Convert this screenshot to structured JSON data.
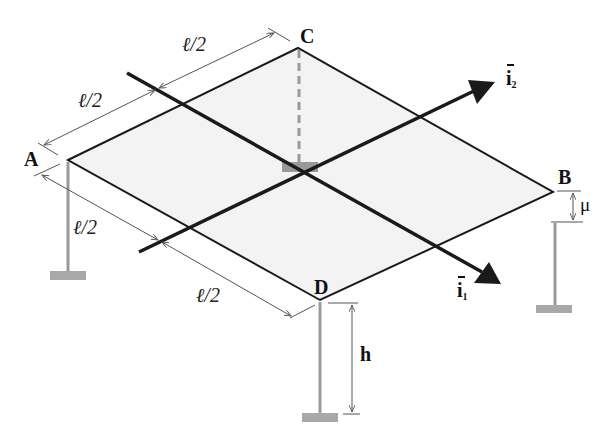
{
  "figure": {
    "type": "isometric plate on three columns",
    "colors": {
      "plate_fill": "#f3f3f3",
      "plate_edge": "#1a1a1a",
      "axis": "#1a1a1a",
      "column": "#9a9a9a",
      "support": "#a8a8a8",
      "dim_line": "#555555"
    }
  },
  "points": {
    "A": "A",
    "B": "B",
    "C": "C",
    "D": "D"
  },
  "dimensions": {
    "top_left_half": "ℓ/2",
    "top_right_half": "ℓ/2",
    "bottom_left_half": "ℓ/2",
    "bottom_right_half": "ℓ/2",
    "column_height": "h",
    "offset_B": "μ"
  },
  "axes": {
    "i1": {
      "symbol": "i",
      "subscript": "1"
    },
    "i2": {
      "symbol": "i",
      "subscript": "2"
    }
  }
}
